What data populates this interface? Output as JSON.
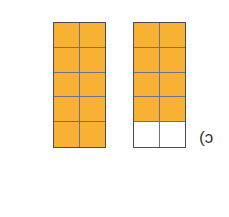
{
  "figure": {
    "label": "c)",
    "fill_color": "#f8b133",
    "empty_color": "#ffffff",
    "grids": [
      {
        "name": "left",
        "rows": 5,
        "cols": 2,
        "shaded_cells": 10,
        "total_cells": 10
      },
      {
        "name": "right",
        "rows": 5,
        "cols": 2,
        "shaded_cells": 8,
        "total_cells": 10
      }
    ]
  }
}
